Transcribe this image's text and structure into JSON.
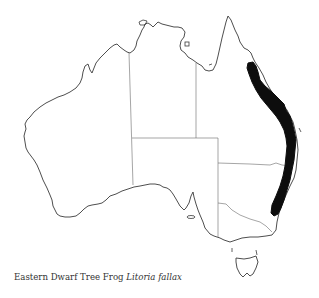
{
  "figure": {
    "type": "species distribution map",
    "region": "Australia",
    "caption": {
      "common_name": "Eastern Dwarf Tree Frog",
      "scientific_name": "Litoria fallax"
    },
    "colors": {
      "background": "#ffffff",
      "outline": "#3a3a3a",
      "state_border": "#6a6a6a",
      "distribution_fill": "#0d0d0d",
      "caption_text": "#333333"
    },
    "distribution": {
      "description": "Black band along the east coast from north Queensland to central New South Wales"
    }
  }
}
